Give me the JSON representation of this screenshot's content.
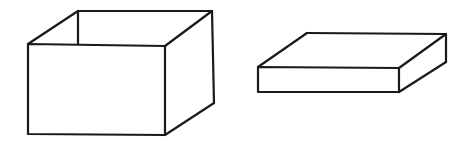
{
  "canvas": {
    "width": 469,
    "height": 144,
    "background": "#ffffff"
  },
  "style": {
    "stroke_color": "#1a1a1a",
    "stroke_width": 2.2,
    "face_fill": "#ffffff"
  },
  "figures": [
    {
      "id": "open-box",
      "description": "Open-top box (no lid), shown in oblique projection",
      "front_face": "28,44 165,46 165,135 28,134",
      "right_face": "165,46 212,11 214,103 165,135",
      "edges": [
        {
          "name": "front-face",
          "points": "28,44 165,46 165,135 28,134 28,44"
        },
        {
          "name": "top-left-edge",
          "points": "28,44 78,11"
        },
        {
          "name": "top-back-edge",
          "points": "78,11 212,11"
        },
        {
          "name": "top-right-edge",
          "points": "165,46 212,11"
        },
        {
          "name": "right-back-vertical",
          "points": "212,11 214,103"
        },
        {
          "name": "bottom-right-edge",
          "points": "214,103 165,135"
        },
        {
          "name": "inner-back-vertical",
          "points": "78,11 78,44"
        }
      ]
    },
    {
      "id": "lid",
      "description": "Flat box lid, shown in oblique projection",
      "front_face": "258,67 399,68 399,92 258,92",
      "top_face": "258,67 307,33 446,34 399,68",
      "right_face": "399,68 446,34 446,62 399,92",
      "edges": [
        {
          "name": "front-face",
          "points": "258,67 399,68 399,92 258,92 258,67"
        },
        {
          "name": "top-left-edge",
          "points": "258,67 307,33"
        },
        {
          "name": "top-back-edge",
          "points": "307,33 446,34"
        },
        {
          "name": "top-right-edge",
          "points": "399,68 446,34"
        },
        {
          "name": "right-back-vertical",
          "points": "446,34 446,62"
        },
        {
          "name": "bottom-right-edge",
          "points": "446,62 399,92"
        }
      ]
    }
  ]
}
